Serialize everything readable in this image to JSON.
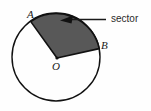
{
  "figure": {
    "type": "geometry-diagram",
    "background_color": "#fefefe",
    "stroke_color": "#111111",
    "sector_fill_color": "#585858",
    "callout": {
      "label": "sector",
      "leader_line": true,
      "arrow_direction": "left"
    },
    "circle": {
      "center_x": 56,
      "center_y": 57,
      "radius": 44
    },
    "points": [
      {
        "id": "A",
        "label": "A",
        "x": 33,
        "y": 22,
        "role": "arc-endpoint"
      },
      {
        "id": "B",
        "label": "B",
        "x": 99,
        "y": 48,
        "role": "arc-endpoint"
      },
      {
        "id": "O",
        "label": "O",
        "x": 57,
        "y": 58,
        "role": "center"
      }
    ],
    "sector": {
      "start_angle_deg": 125,
      "end_angle_deg": 11,
      "vertex": "O",
      "arc_from": "A",
      "arc_to": "B"
    }
  }
}
